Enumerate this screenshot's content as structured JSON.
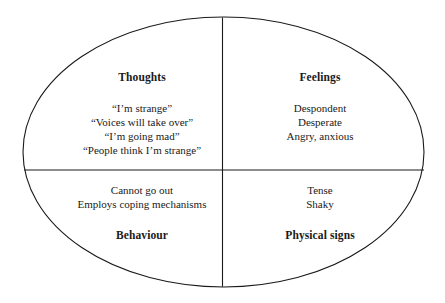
{
  "diagram": {
    "shape": "ellipse",
    "colors": {
      "background": "#ffffff",
      "stroke": "#1a1a1a",
      "text": "#1a1a1a"
    },
    "quadrants": [
      {
        "id": "thoughts",
        "heading": "Thoughts",
        "heading_position": "top",
        "lines": [
          "“I’m strange”",
          "“Voices will take over”",
          "“I’m going mad”",
          "“People think I’m strange”"
        ]
      },
      {
        "id": "feelings",
        "heading": "Feelings",
        "heading_position": "top",
        "lines": [
          "Despondent",
          "Desperate",
          "Angry, anxious"
        ]
      },
      {
        "id": "behaviour",
        "heading": "Behaviour",
        "heading_position": "bottom",
        "lines": [
          "Cannot go out",
          "Employs coping mechanisms"
        ]
      },
      {
        "id": "physical",
        "heading": "Physical signs",
        "heading_position": "bottom",
        "lines": [
          "Tense",
          "Shaky"
        ]
      }
    ]
  }
}
